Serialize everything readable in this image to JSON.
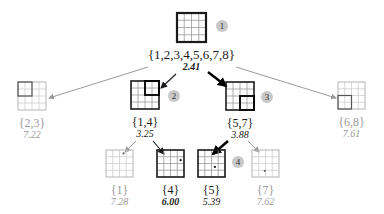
{
  "colors": {
    "active": "#1a1a1a",
    "inactive": "#9a9a9a",
    "grid_active": "#555555",
    "grid_inactive": "#b4b4b4",
    "badge_bg": "#c8c8c8"
  },
  "nodes": [
    {
      "id": "root",
      "set": "{1,2,3,4,5,6,7,8}",
      "score": "2.41",
      "x": 177,
      "y": 13,
      "size": 29,
      "active": true,
      "bold_score": true,
      "highlight": null,
      "dot": null,
      "badge": "1"
    },
    {
      "id": "n23",
      "set": "{2,3}",
      "score": "7.22",
      "x": 18,
      "y": 82,
      "size": 28,
      "active": false,
      "bold_score": false,
      "highlight": [
        0,
        0
      ],
      "dot": null,
      "badge": null
    },
    {
      "id": "n14",
      "set": "{1,4}",
      "score": "3.25",
      "x": 131,
      "y": 81,
      "size": 28,
      "active": true,
      "bold_score": false,
      "highlight": [
        2,
        0
      ],
      "dot": null,
      "badge": "2"
    },
    {
      "id": "n57",
      "set": "{5,7}",
      "score": "3.88",
      "x": 226,
      "y": 82,
      "size": 28,
      "active": true,
      "bold_score": false,
      "highlight": [
        2,
        2
      ],
      "dot": null,
      "badge": "3"
    },
    {
      "id": "n68",
      "set": "{6,8}",
      "score": "7.61",
      "x": 338,
      "y": 82,
      "size": 27,
      "active": false,
      "bold_score": false,
      "highlight": [
        0,
        2
      ],
      "dot": null,
      "badge": null
    },
    {
      "id": "n1",
      "set": "{1}",
      "score": "7.28",
      "x": 106,
      "y": 150,
      "size": 27,
      "active": false,
      "bold_score": false,
      "highlight": null,
      "dot": [
        2.6,
        0.5
      ],
      "badge": null
    },
    {
      "id": "n4",
      "set": "{4}",
      "score": "6.00",
      "x": 157,
      "y": 150,
      "size": 27,
      "active": true,
      "bold_score": true,
      "highlight": null,
      "dot": [
        3.5,
        1.5
      ],
      "badge": null
    },
    {
      "id": "n5",
      "set": "{5}",
      "score": "5.39",
      "x": 198,
      "y": 150,
      "size": 27,
      "active": true,
      "bold_score": false,
      "highlight": null,
      "dot": [
        2.5,
        2.5
      ],
      "badge": "4"
    },
    {
      "id": "n7",
      "set": "{7}",
      "score": "7.62",
      "x": 252,
      "y": 150,
      "size": 27,
      "active": false,
      "bold_score": false,
      "highlight": null,
      "dot": [
        1.9,
        3.1
      ],
      "badge": null
    }
  ],
  "edges": [
    {
      "from": "root",
      "to": "n23",
      "x1": 148,
      "y1": 67,
      "x2": 49,
      "y2": 98,
      "style": "thin-gray"
    },
    {
      "from": "root",
      "to": "n14",
      "x1": 176,
      "y1": 74,
      "x2": 161,
      "y2": 88,
      "style": "thin-dark"
    },
    {
      "from": "root",
      "to": "n57",
      "x1": 208,
      "y1": 72,
      "x2": 226,
      "y2": 86,
      "style": "thick-dark"
    },
    {
      "from": "root",
      "to": "n68",
      "x1": 236,
      "y1": 67,
      "x2": 336,
      "y2": 98,
      "style": "thin-gray"
    },
    {
      "from": "n14",
      "to": "n1",
      "x1": 136,
      "y1": 141,
      "x2": 125,
      "y2": 152,
      "style": "thin-gray"
    },
    {
      "from": "n14",
      "to": "n4",
      "x1": 153,
      "y1": 141,
      "x2": 164,
      "y2": 154,
      "style": "thin-dark"
    },
    {
      "from": "n57",
      "to": "n5",
      "x1": 228,
      "y1": 141,
      "x2": 213,
      "y2": 154,
      "style": "thick-dark"
    },
    {
      "from": "n57",
      "to": "n7",
      "x1": 248,
      "y1": 141,
      "x2": 259,
      "y2": 152,
      "style": "thin-gray"
    }
  ],
  "badges": [
    {
      "label": "1",
      "x": 222,
      "y": 26
    },
    {
      "label": "2",
      "x": 174,
      "y": 96
    },
    {
      "label": "3",
      "x": 267,
      "y": 97
    },
    {
      "label": "4",
      "x": 238,
      "y": 162
    }
  ]
}
